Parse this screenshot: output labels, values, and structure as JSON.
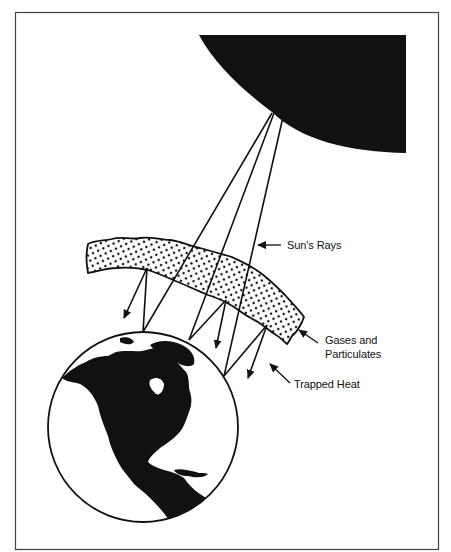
{
  "diagram": {
    "type": "greenhouse-effect-illustration",
    "colors": {
      "ink": "#111111",
      "background": "#ffffff",
      "frame": "#444444"
    },
    "elements": {
      "sun": {
        "name": "Sun",
        "shape": "quarter-disc",
        "fill": "#111111"
      },
      "atmosphere": {
        "name": "Gases and Particulates layer",
        "pattern": "dotted"
      },
      "earth": {
        "name": "Earth globe showing North America",
        "fill": "#111111"
      }
    },
    "labels": {
      "suns_rays": "Sun's Rays",
      "gases_line1": "Gases and",
      "gases_line2": "Particulates",
      "trapped_heat": "Trapped Heat"
    },
    "rays": [
      {
        "id": "ray-1",
        "from": [
          272,
          113
        ],
        "hit_earth": [
          143,
          328
        ],
        "reflect_to": [
          147,
          268
        ],
        "trapped_arrow_to": [
          123,
          318
        ]
      },
      {
        "id": "ray-2",
        "from": [
          274,
          113
        ],
        "hit_earth": [
          189,
          340
        ],
        "reflect_to": [
          226,
          300
        ],
        "trapped_arrow_to": [
          216,
          348
        ]
      },
      {
        "id": "ray-3",
        "from": [
          283,
          117
        ],
        "hit_earth": [
          224,
          376
        ],
        "reflect_to": [
          267,
          325
        ],
        "trapped_arrow_to": [
          248,
          378
        ]
      }
    ]
  }
}
